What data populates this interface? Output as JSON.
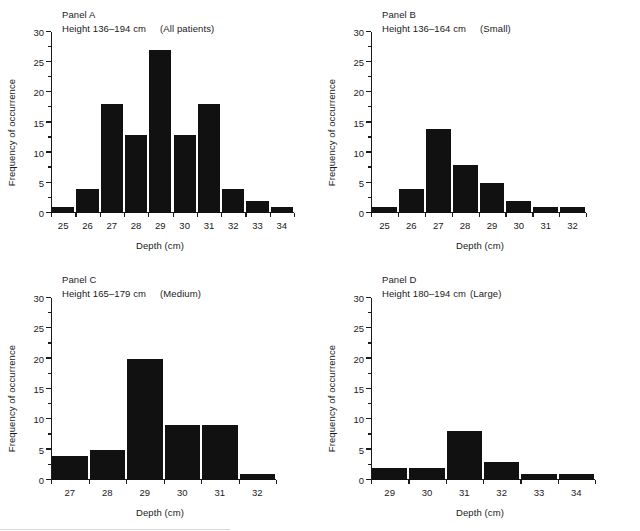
{
  "figure": {
    "axis_label_y": "Frequency of occurrence",
    "axis_label_x": "Depth (cm)",
    "bar_color": "#111111",
    "axis_color": "#1a1a1a",
    "background": "#ffffff"
  },
  "chart_data": [
    {
      "type": "bar",
      "panel": "Panel A",
      "title": "Panel A",
      "subtitle": "Height 136–194 cm",
      "group": "(All patients)",
      "height_range": "136–194 cm",
      "categories": [
        "25",
        "26",
        "27",
        "28",
        "29",
        "30",
        "31",
        "32",
        "33",
        "34"
      ],
      "values": [
        1,
        4,
        18,
        13,
        27,
        13,
        18,
        4,
        2,
        1
      ],
      "xlabel": "Depth (cm)",
      "ylabel": "Frequency of occurrence",
      "ylim": [
        0,
        30
      ],
      "yticks": [
        0,
        5,
        10,
        15,
        20,
        25,
        30
      ],
      "yminor_step": 2.5,
      "grid": false,
      "legend": "none"
    },
    {
      "type": "bar",
      "panel": "Panel B",
      "title": "Panel B",
      "subtitle": "Height 136–164 cm",
      "group": "(Small)",
      "height_range": "136–164 cm",
      "categories": [
        "25",
        "26",
        "27",
        "28",
        "29",
        "30",
        "31",
        "32"
      ],
      "values": [
        1,
        4,
        14,
        8,
        5,
        2,
        1,
        1
      ],
      "xlabel": "Depth (cm)",
      "ylabel": "Frequency of occurrence",
      "ylim": [
        0,
        30
      ],
      "yticks": [
        0,
        5,
        10,
        15,
        20,
        25,
        30
      ],
      "yminor_step": 2.5,
      "grid": false,
      "legend": "none"
    },
    {
      "type": "bar",
      "panel": "Panel C",
      "title": "Panel C",
      "subtitle": "Height 165–179 cm",
      "group": "(Medium)",
      "height_range": "165–179 cm",
      "categories": [
        "27",
        "28",
        "29",
        "30",
        "31",
        "32"
      ],
      "values": [
        4,
        5,
        20,
        9,
        9,
        1
      ],
      "xlabel": "Depth (cm)",
      "ylabel": "Frequency of occurrence",
      "ylim": [
        0,
        30
      ],
      "yticks": [
        0,
        5,
        10,
        15,
        20,
        25,
        30
      ],
      "yminor_step": 2.5,
      "grid": false,
      "legend": "none"
    },
    {
      "type": "bar",
      "panel": "Panel D",
      "title": "Panel D",
      "subtitle": "Height 180–194 cm",
      "group": "(Large)",
      "group_tight": true,
      "height_range": "180–194 cm",
      "categories": [
        "29",
        "30",
        "31",
        "32",
        "33",
        "34"
      ],
      "values": [
        2,
        2,
        8,
        3,
        1,
        1
      ],
      "xlabel": "Depth (cm)",
      "ylabel": "Frequency of occurrence",
      "ylim": [
        0,
        30
      ],
      "yticks": [
        0,
        5,
        10,
        15,
        20,
        25,
        30
      ],
      "yminor_step": 2.5,
      "grid": false,
      "legend": "none"
    }
  ]
}
